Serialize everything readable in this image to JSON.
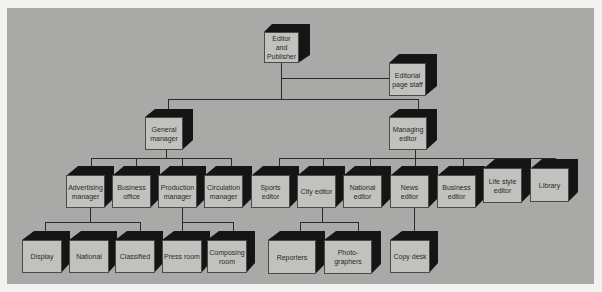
{
  "diagram": {
    "type": "organization-chart",
    "colors": {
      "background": "#a9aaa8",
      "box_face": "#c1c1be",
      "box_shadow": "#151515",
      "line": "#2b2b2b"
    },
    "nodes": {
      "editor_publisher": {
        "label": "Editor and Publisher"
      },
      "editorial_page_staff": {
        "label": "Editorial page staff"
      },
      "general_manager": {
        "label": "General manager"
      },
      "managing_editor": {
        "label": "Managing editor"
      },
      "advertising_manager": {
        "label": "Advertising manager"
      },
      "business_office": {
        "label": "Business office"
      },
      "production_manager": {
        "label": "Production manager"
      },
      "circulation_manager": {
        "label": "Circulation manager"
      },
      "sports_editor": {
        "label": "Sports editor"
      },
      "city_editor": {
        "label": "City editor"
      },
      "national_editor": {
        "label": "National editor"
      },
      "news_editor": {
        "label": "News editor"
      },
      "business_editor": {
        "label": "Business editor"
      },
      "life_style_editor": {
        "label": "Life style editor"
      },
      "library": {
        "label": "Library"
      },
      "display": {
        "label": "Display"
      },
      "national": {
        "label": "National"
      },
      "classified": {
        "label": "Classified"
      },
      "press_room": {
        "label": "Press room"
      },
      "composing_room": {
        "label": "Composing room"
      },
      "reporters": {
        "label": "Reporters"
      },
      "photographers": {
        "label": "Photo-graphers"
      },
      "copy_desk": {
        "label": "Copy desk"
      }
    },
    "edges": [
      [
        "editor_publisher",
        "editorial_page_staff"
      ],
      [
        "editor_publisher",
        "general_manager"
      ],
      [
        "editor_publisher",
        "managing_editor"
      ],
      [
        "general_manager",
        "advertising_manager"
      ],
      [
        "general_manager",
        "business_office"
      ],
      [
        "general_manager",
        "production_manager"
      ],
      [
        "general_manager",
        "circulation_manager"
      ],
      [
        "managing_editor",
        "sports_editor"
      ],
      [
        "managing_editor",
        "city_editor"
      ],
      [
        "managing_editor",
        "national_editor"
      ],
      [
        "managing_editor",
        "news_editor"
      ],
      [
        "managing_editor",
        "business_editor"
      ],
      [
        "managing_editor",
        "life_style_editor"
      ],
      [
        "managing_editor",
        "library"
      ],
      [
        "advertising_manager",
        "display"
      ],
      [
        "advertising_manager",
        "national"
      ],
      [
        "advertising_manager",
        "classified"
      ],
      [
        "production_manager",
        "press_room"
      ],
      [
        "production_manager",
        "composing_room"
      ],
      [
        "city_editor",
        "reporters"
      ],
      [
        "city_editor",
        "photographers"
      ],
      [
        "news_editor",
        "copy_desk"
      ]
    ]
  }
}
